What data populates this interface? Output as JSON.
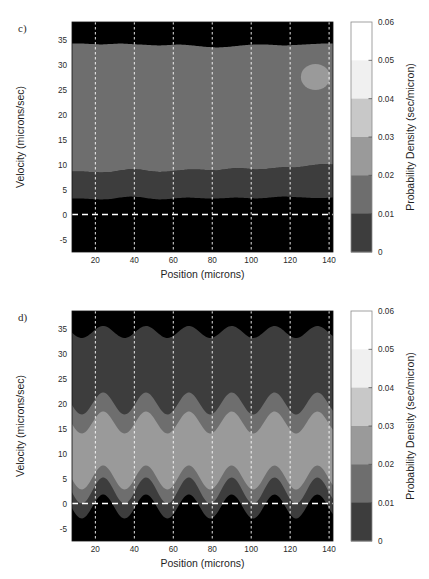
{
  "figure": {
    "width": 429,
    "height": 579,
    "background": "#ffffff",
    "panels": [
      {
        "id": "c",
        "label": "c)",
        "label_x": 18,
        "label_y": 30,
        "plot": {
          "x": 72,
          "y": 22,
          "w": 261,
          "h": 230
        },
        "colorbar": {
          "x": 351,
          "y": 22,
          "w": 21,
          "h": 230
        }
      },
      {
        "id": "d",
        "label": "d)",
        "label_x": 18,
        "label_y": 30,
        "plot": {
          "x": 72,
          "y": 22,
          "w": 261,
          "h": 230
        },
        "colorbar": {
          "x": 351,
          "y": 22,
          "w": 21,
          "h": 230
        }
      }
    ]
  },
  "chart_data": [
    {
      "panel": "c",
      "type": "heatmap",
      "subtype": "filled-contour",
      "title": "",
      "xlabel": "Position (microns)",
      "ylabel": "Velocity (microns/sec)",
      "clabel": "Probability Density (sec/micron)",
      "xlim": [
        8,
        142
      ],
      "ylim": [
        -7.5,
        38.5
      ],
      "xticks": [
        20,
        40,
        60,
        80,
        100,
        120,
        140
      ],
      "yticks": [
        -5,
        0,
        5,
        10,
        15,
        20,
        25,
        30,
        35
      ],
      "grid": "dashed-white-vertical",
      "zero_line": {
        "value": 0,
        "style": "dashed",
        "color": "#ffffff"
      },
      "clim": [
        0,
        0.06
      ],
      "contour_levels": [
        0,
        0.01,
        0.02,
        0.03,
        0.04,
        0.05,
        0.06
      ],
      "colors": [
        "#000000",
        "#3d3d3d",
        "#6e6e6e",
        "#9a9a9a",
        "#c8c8c8",
        "#f0f0f0",
        "#ffffff"
      ],
      "description": "Nearly horizontal flat bands: density peaks in a broad 0.02-0.03 plateau spanning v=8.5 to v=33.5, with thin 0.01-0.02 band v=3 to 8.5 and black (<0.01) below v=3 and above v=34. A small isolated 0.03-0.04 lens near x=133, v=27.5.",
      "bands": [
        {
          "level_lo": 0.01,
          "level_hi": 0.02,
          "color": "#3d3d3d",
          "lower_boundary_y": [
            3.2,
            3.2,
            3.1,
            3.0,
            3.1,
            3.4,
            3.6,
            3.5,
            3.2,
            3.0,
            3.1,
            3.3,
            3.4,
            3.3,
            3.2,
            3.2,
            3.3,
            3.4,
            3.3,
            3.2,
            3.3,
            3.5,
            3.6,
            3.5,
            3.4,
            3.3,
            3.3,
            3.4
          ],
          "upper_boundary_y": [
            8.6,
            8.6,
            8.5,
            8.4,
            8.5,
            8.8,
            9.1,
            9.0,
            8.7,
            8.5,
            8.6,
            8.8,
            9.0,
            9.0,
            8.9,
            8.8,
            9.1,
            9.3,
            9.2,
            9.0,
            9.1,
            9.3,
            9.5,
            9.4,
            9.6,
            9.9,
            10.1,
            10.0
          ]
        },
        {
          "level_lo": 0.02,
          "level_hi": 0.03,
          "color": "#6e6e6e",
          "lower_boundary_y": [
            8.6,
            8.6,
            8.5,
            8.4,
            8.5,
            8.8,
            9.1,
            9.0,
            8.7,
            8.5,
            8.6,
            8.8,
            9.0,
            9.0,
            8.9,
            8.8,
            9.1,
            9.3,
            9.2,
            9.0,
            9.1,
            9.3,
            9.5,
            9.4,
            9.6,
            9.9,
            10.1,
            10.0
          ],
          "upper_boundary_y": [
            34.2,
            34.2,
            34.1,
            34.0,
            34.1,
            34.2,
            34.1,
            34.0,
            33.9,
            33.8,
            33.9,
            34.0,
            33.9,
            33.7,
            33.5,
            33.4,
            33.5,
            33.7,
            33.9,
            34.0,
            34.0,
            33.9,
            33.8,
            33.9,
            34.0,
            34.1,
            34.2,
            34.2
          ]
        }
      ],
      "inset_blob": {
        "level_lo": 0.03,
        "level_hi": 0.04,
        "color": "#9a9a9a",
        "center_x": 133,
        "center_y": 27.5,
        "rx": 7.5,
        "ry": 2.6
      }
    },
    {
      "panel": "d",
      "type": "heatmap",
      "subtype": "filled-contour",
      "title": "",
      "xlabel": "Position (microns)",
      "ylabel": "Velocity (microns/sec)",
      "clabel": "Probability Density (sec/micron)",
      "xlim": [
        8,
        142
      ],
      "ylim": [
        -7.5,
        38.5
      ],
      "xticks": [
        20,
        40,
        60,
        80,
        100,
        120,
        140
      ],
      "yticks": [
        -5,
        0,
        5,
        10,
        15,
        20,
        25,
        30,
        35
      ],
      "grid": "dashed-white-vertical",
      "zero_line": {
        "value": 0,
        "style": "dashed",
        "color": "#ffffff"
      },
      "clim": [
        0,
        0.06
      ],
      "contour_levels": [
        0,
        0.01,
        0.02,
        0.03,
        0.04,
        0.05,
        0.06
      ],
      "colors": [
        "#000000",
        "#3d3d3d",
        "#6e6e6e",
        "#9a9a9a",
        "#c8c8c8",
        "#f0f0f0",
        "#ffffff"
      ],
      "description": "Strongly oscillating nested bands with roughly 6 periods across x=8..142 (period ~22 microns). Brightest 0.03-0.04 core centred near v=11, oscillating between v=5 and v=17; successive darker bands nest outward, black below v~0 and above v~34.",
      "oscillation": {
        "period_microns": 22.0,
        "phase_offset_microns": 2.0,
        "n_periods": 6
      },
      "bands": [
        {
          "level_lo": 0.01,
          "level_hi": 0.02,
          "color": "#3d3d3d",
          "lower_center": -0.6,
          "lower_amp": 2.4,
          "upper_center": 23.5,
          "upper_amp": 2.2
        },
        {
          "level_lo": 0.02,
          "level_hi": 0.03,
          "color": "#6e6e6e",
          "lower_center": 2.6,
          "lower_amp": 2.6,
          "upper_center": 20.0,
          "upper_amp": 2.2
        },
        {
          "level_lo": 0.03,
          "level_hi": 0.04,
          "color": "#9a9a9a",
          "lower_center": 5.2,
          "lower_amp": 2.4,
          "upper_center": 16.2,
          "upper_amp": 2.2
        }
      ],
      "top_boundary": {
        "center": 34.3,
        "amp": 1.2
      }
    }
  ],
  "colorbar": {
    "label": "Probability Density (sec/micron)",
    "ticks": [
      "0.06",
      "0.05",
      "0.04",
      "0.03",
      "0.02",
      "0.01",
      "0"
    ],
    "tick_values": [
      0.06,
      0.05,
      0.04,
      0.03,
      0.02,
      0.01,
      0
    ],
    "swatches": [
      {
        "range": "0.05 - 0.06",
        "color": "#ffffff"
      },
      {
        "range": "0.04 - 0.05",
        "color": "#f0f0f0"
      },
      {
        "range": "0.03 - 0.04",
        "color": "#c8c8c8"
      },
      {
        "range": "0.02 - 0.03",
        "color": "#9a9a9a"
      },
      {
        "range": "0.01 - 0.02",
        "color": "#6e6e6e"
      },
      {
        "range": "0 - 0.01",
        "color": "#3d3d3d"
      }
    ],
    "border_color": "#8a8a8a"
  },
  "axes": {
    "xlabel": "Position (microns)",
    "ylabel": "Velocity (microns/sec)",
    "xticks": [
      "20",
      "40",
      "60",
      "80",
      "100",
      "120",
      "140"
    ],
    "yticks": [
      "35",
      "30",
      "25",
      "20",
      "15",
      "10",
      "5",
      "0",
      "-5"
    ]
  }
}
